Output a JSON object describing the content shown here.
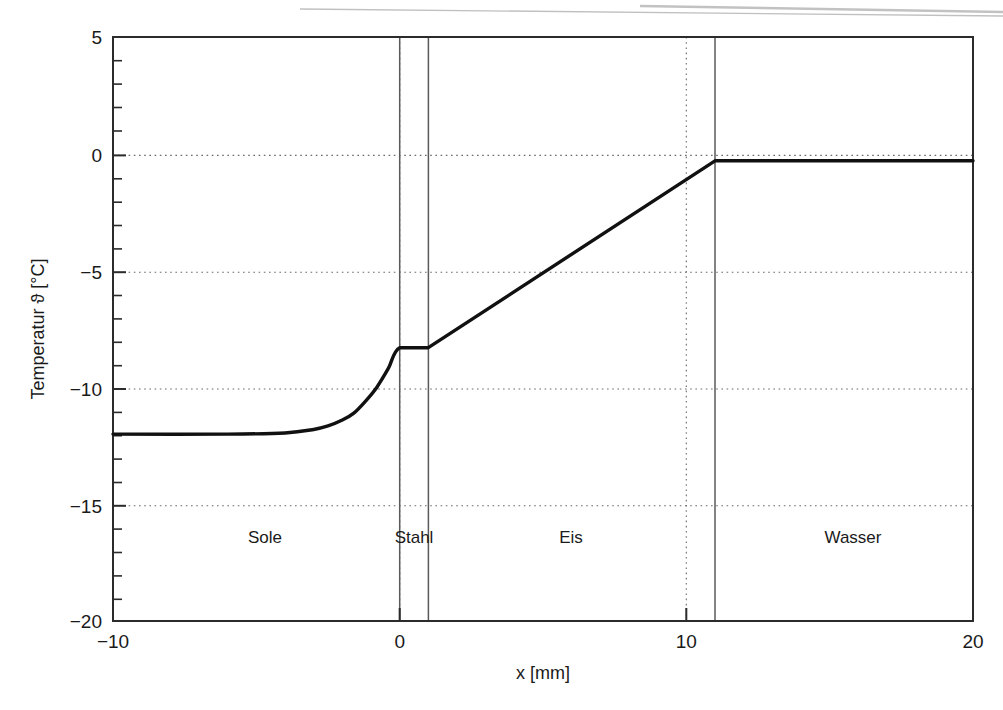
{
  "chart_data": {
    "type": "line",
    "title": "",
    "xlabel": "x [mm]",
    "ylabel": "Temperatur ϑ [°C]",
    "xlim": [
      -10,
      20
    ],
    "ylim": [
      -20,
      5
    ],
    "xticks": [
      -10,
      0,
      10,
      20
    ],
    "xtick_labels": [
      "−10",
      "0",
      "10",
      "20"
    ],
    "yticks": [
      5,
      0,
      -5,
      -10,
      -15,
      -20
    ],
    "ytick_labels": [
      "5",
      "0",
      "−5",
      "−10",
      "−15",
      "−20"
    ],
    "y_minor_tick_step": 1,
    "grid": "dotted horizontal gridlines at y = 0, -5, -10, -15; dotted vertical gridlines at x = 0, 10",
    "grid_x": [
      0,
      10
    ],
    "grid_y": [
      0,
      -5,
      -10,
      -15
    ],
    "legend": "none",
    "series": [
      {
        "name": "Temperaturprofil",
        "color": "#111111",
        "linewidth": 3,
        "x": [
          -10,
          -6,
          -4,
          -3,
          -2.5,
          -2,
          -1.6,
          -1.2,
          -0.8,
          -0.4,
          0,
          1,
          11,
          12,
          20
        ],
        "values": [
          -12.0,
          -12.0,
          -11.95,
          -11.8,
          -11.65,
          -11.4,
          -11.1,
          -10.6,
          -10.0,
          -9.2,
          -8.3,
          -8.3,
          -0.3,
          -0.3,
          -0.3
        ]
      }
    ],
    "material_boundaries": [
      0,
      1,
      11
    ],
    "regions": [
      {
        "label": "Sole",
        "x_start": -10,
        "x_end": 0,
        "label_x": -5.3
      },
      {
        "label": "Stahl",
        "x_start": 0,
        "x_end": 1,
        "label_x": 0.5
      },
      {
        "label": "Eis",
        "x_start": 1,
        "x_end": 11,
        "label_x": 5.3
      },
      {
        "label": "Wasser",
        "x_start": 11,
        "x_end": 20,
        "label_x": 15.3
      }
    ],
    "region_label_y": -16.1,
    "annotations": [
      "Sole plateau at -12 °C",
      "Stahl plateau at -8.3 °C",
      "Wasser plateau at -0.3 °C"
    ]
  },
  "colors": {
    "curve": "#111111",
    "axis": "#2b2b2b",
    "grid": "#6a6a6a",
    "boundary": "#555555",
    "background": "#ffffff",
    "scan_artifact": "#9a9a9a"
  },
  "regions": {
    "sole": "Sole",
    "stahl": "Stahl",
    "eis": "Eis",
    "wasser": "Wasser"
  },
  "axes": {
    "x_title": "x [mm]",
    "y_title": "Temperatur ϑ [°C]",
    "x_tick_0": "−10",
    "x_tick_1": "0",
    "x_tick_2": "10",
    "x_tick_3": "20",
    "y_tick_0": "5",
    "y_tick_1": "0",
    "y_tick_2": "−5",
    "y_tick_3": "−10",
    "y_tick_4": "−15",
    "y_tick_5": "−20"
  }
}
